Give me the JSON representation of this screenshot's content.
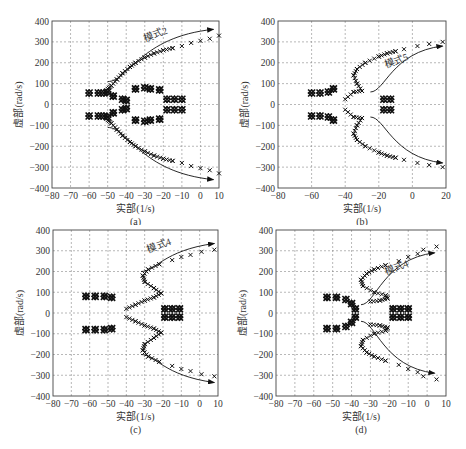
{
  "chart_data": [
    {
      "panel": "a",
      "type": "scatter",
      "caption": "(a)",
      "xlabel": "实部(1/s)",
      "ylabel": "虚部(rad/s)",
      "xlim": [
        -80,
        10
      ],
      "ylim": [
        -400,
        400
      ],
      "xticks": [
        -80,
        -70,
        -60,
        -50,
        -40,
        -30,
        -20,
        -10,
        0,
        10
      ],
      "yticks": [
        400,
        300,
        200,
        100,
        0,
        -100,
        -200,
        -300,
        -400
      ],
      "grid": true,
      "annotation": "模式2",
      "series": [
        {
          "name": "模式2 upper",
          "points": [
            [
              -50,
              75
            ],
            [
              -48,
              90
            ],
            [
              -45,
              120
            ],
            [
              -42,
              150
            ],
            [
              -38,
              180
            ],
            [
              -35,
              200
            ],
            [
              -30,
              225
            ],
            [
              -25,
              245
            ],
            [
              -20,
              260
            ],
            [
              -15,
              270
            ],
            [
              -10,
              280
            ],
            [
              -5,
              295
            ],
            [
              0,
              305
            ],
            [
              5,
              315
            ],
            [
              10,
              330
            ]
          ]
        },
        {
          "name": "模式2 lower",
          "points": [
            [
              -50,
              -75
            ],
            [
              -48,
              -90
            ],
            [
              -45,
              -120
            ],
            [
              -42,
              -150
            ],
            [
              -38,
              -180
            ],
            [
              -35,
              -200
            ],
            [
              -30,
              -225
            ],
            [
              -25,
              -245
            ],
            [
              -20,
              -260
            ],
            [
              -15,
              -270
            ],
            [
              -10,
              -280
            ],
            [
              -5,
              -295
            ],
            [
              0,
              -305
            ],
            [
              5,
              -315
            ],
            [
              10,
              -330
            ]
          ]
        },
        {
          "name": "cluster 1",
          "points": [
            [
              -60,
              55
            ],
            [
              -55,
              55
            ],
            [
              -52,
              55
            ],
            [
              -60,
              -55
            ],
            [
              -55,
              -55
            ],
            [
              -52,
              -55
            ]
          ]
        },
        {
          "name": "cluster 2",
          "points": [
            [
              -50,
              60
            ],
            [
              -47,
              40
            ],
            [
              -42,
              25
            ],
            [
              -40,
              20
            ],
            [
              -50,
              -60
            ],
            [
              -47,
              -40
            ],
            [
              -42,
              -25
            ],
            [
              -40,
              -20
            ]
          ]
        },
        {
          "name": "cluster 3",
          "points": [
            [
              -35,
              75
            ],
            [
              -30,
              80
            ],
            [
              -27,
              75
            ],
            [
              -22,
              70
            ],
            [
              -35,
              -75
            ],
            [
              -30,
              -80
            ],
            [
              -27,
              -75
            ],
            [
              -22,
              -70
            ]
          ]
        },
        {
          "name": "cluster 4",
          "points": [
            [
              -18,
              25
            ],
            [
              -14,
              25
            ],
            [
              -10,
              25
            ],
            [
              -18,
              -25
            ],
            [
              -14,
              -25
            ],
            [
              -10,
              -25
            ]
          ]
        }
      ],
      "arrows": [
        {
          "from": [
            -50,
            110
          ],
          "to": [
            7,
            360
          ]
        },
        {
          "from": [
            -50,
            -110
          ],
          "to": [
            7,
            -360
          ]
        }
      ]
    },
    {
      "panel": "b",
      "type": "scatter",
      "caption": "(b)",
      "xlabel": "实部(1/s)",
      "ylabel": "虚部(rad/s)",
      "xlim": [
        -80,
        20
      ],
      "ylim": [
        -400,
        400
      ],
      "xticks": [
        -80,
        -60,
        -40,
        -20,
        0,
        20
      ],
      "yticks": [
        400,
        300,
        200,
        100,
        0,
        -100,
        -200,
        -300,
        -400
      ],
      "grid": true,
      "annotation": "模式5",
      "series": [
        {
          "name": "模式5 upper",
          "points": [
            [
              -40,
              25
            ],
            [
              -35,
              60
            ],
            [
              -30,
              65
            ],
            [
              -33,
              100
            ],
            [
              -35,
              140
            ],
            [
              -33,
              170
            ],
            [
              -28,
              200
            ],
            [
              -20,
              230
            ],
            [
              -15,
              245
            ],
            [
              -10,
              255
            ],
            [
              -5,
              265
            ],
            [
              3,
              280
            ],
            [
              10,
              290
            ],
            [
              18,
              300
            ]
          ]
        },
        {
          "name": "模式5 lower",
          "points": [
            [
              -40,
              -25
            ],
            [
              -35,
              -60
            ],
            [
              -30,
              -65
            ],
            [
              -33,
              -100
            ],
            [
              -35,
              -140
            ],
            [
              -33,
              -170
            ],
            [
              -28,
              -200
            ],
            [
              -20,
              -230
            ],
            [
              -15,
              -245
            ],
            [
              -10,
              -255
            ],
            [
              -5,
              -265
            ],
            [
              3,
              -280
            ],
            [
              10,
              -290
            ],
            [
              18,
              -300
            ]
          ]
        },
        {
          "name": "cluster 1",
          "points": [
            [
              -60,
              55
            ],
            [
              -55,
              55
            ],
            [
              -50,
              60
            ],
            [
              -47,
              75
            ],
            [
              -60,
              -55
            ],
            [
              -55,
              -55
            ],
            [
              -50,
              -60
            ],
            [
              -47,
              -75
            ]
          ]
        },
        {
          "name": "cluster 2",
          "points": [
            [
              -17,
              25
            ],
            [
              -13,
              25
            ],
            [
              -17,
              -25
            ],
            [
              -13,
              -25
            ]
          ]
        }
      ],
      "arrows": [
        {
          "from": [
            -25,
            60
          ],
          "to": [
            18,
            280
          ]
        },
        {
          "from": [
            -25,
            -60
          ],
          "to": [
            18,
            -280
          ]
        }
      ]
    },
    {
      "panel": "c",
      "type": "scatter",
      "caption": "(c)",
      "xlabel": "实部(1/s)",
      "ylabel": "虚部(rad/s)",
      "xlim": [
        -80,
        10
      ],
      "ylim": [
        -400,
        400
      ],
      "xticks": [
        -80,
        -70,
        -60,
        -50,
        -40,
        -30,
        -20,
        -10,
        0,
        10
      ],
      "yticks": [
        400,
        300,
        200,
        100,
        0,
        -100,
        -200,
        -300,
        -400
      ],
      "grid": true,
      "annotation": "模式4",
      "series": [
        {
          "name": "模式4 upper",
          "points": [
            [
              -40,
              20
            ],
            [
              -35,
              40
            ],
            [
              -30,
              60
            ],
            [
              -25,
              75
            ],
            [
              -21,
              95
            ],
            [
              -25,
              120
            ],
            [
              -30,
              150
            ],
            [
              -31,
              180
            ],
            [
              -28,
              210
            ],
            [
              -22,
              235
            ],
            [
              -15,
              255
            ],
            [
              -10,
              270
            ],
            [
              -5,
              280
            ],
            [
              1,
              295
            ],
            [
              8,
              305
            ]
          ]
        },
        {
          "name": "模式4 lower",
          "points": [
            [
              -40,
              -20
            ],
            [
              -35,
              -40
            ],
            [
              -30,
              -60
            ],
            [
              -25,
              -75
            ],
            [
              -21,
              -95
            ],
            [
              -25,
              -120
            ],
            [
              -30,
              -150
            ],
            [
              -31,
              -180
            ],
            [
              -28,
              -210
            ],
            [
              -22,
              -235
            ],
            [
              -15,
              -255
            ],
            [
              -10,
              -270
            ],
            [
              -5,
              -280
            ],
            [
              1,
              -295
            ],
            [
              8,
              -305
            ]
          ]
        },
        {
          "name": "cluster 1",
          "points": [
            [
              -62,
              80
            ],
            [
              -57,
              80
            ],
            [
              -52,
              80
            ],
            [
              -48,
              75
            ],
            [
              -62,
              -80
            ],
            [
              -57,
              -80
            ],
            [
              -52,
              -80
            ],
            [
              -48,
              -75
            ]
          ]
        },
        {
          "name": "cluster 2",
          "points": [
            [
              -19,
              20
            ],
            [
              -15,
              20
            ],
            [
              -11,
              20
            ],
            [
              -19,
              -20
            ],
            [
              -15,
              -20
            ],
            [
              -11,
              -20
            ]
          ]
        }
      ],
      "arrows": [
        {
          "from": [
            -32,
            200
          ],
          "to": [
            8,
            335
          ]
        },
        {
          "from": [
            -32,
            -200
          ],
          "to": [
            8,
            -335
          ]
        }
      ]
    },
    {
      "panel": "d",
      "type": "scatter",
      "caption": "(d)",
      "xlabel": "实部(1/s)",
      "ylabel": "虚部(rad/s)",
      "xlim": [
        -80,
        10
      ],
      "ylim": [
        -400,
        400
      ],
      "xticks": [
        -80,
        -70,
        -60,
        -50,
        -40,
        -30,
        -20,
        -10,
        0,
        10
      ],
      "yticks": [
        400,
        300,
        200,
        100,
        0,
        -100,
        -200,
        -300,
        -400
      ],
      "grid": true,
      "annotation": "模式4",
      "series": [
        {
          "name": "模式4 upper",
          "points": [
            [
              -30,
              55
            ],
            [
              -25,
              60
            ],
            [
              -21,
              70
            ],
            [
              -22,
              85
            ],
            [
              -28,
              100
            ],
            [
              -34,
              130
            ],
            [
              -35,
              160
            ],
            [
              -32,
              190
            ],
            [
              -28,
              210
            ],
            [
              -22,
              230
            ],
            [
              -15,
              250
            ],
            [
              -10,
              270
            ],
            [
              -5,
              285
            ],
            [
              -2,
              305
            ],
            [
              5,
              320
            ]
          ]
        },
        {
          "name": "模式4 lower",
          "points": [
            [
              -30,
              -55
            ],
            [
              -25,
              -60
            ],
            [
              -21,
              -70
            ],
            [
              -22,
              -85
            ],
            [
              -28,
              -100
            ],
            [
              -34,
              -130
            ],
            [
              -35,
              -160
            ],
            [
              -32,
              -190
            ],
            [
              -28,
              -210
            ],
            [
              -22,
              -230
            ],
            [
              -15,
              -250
            ],
            [
              -10,
              -270
            ],
            [
              -5,
              -285
            ],
            [
              -2,
              -305
            ],
            [
              5,
              -320
            ]
          ]
        },
        {
          "name": "cluster 1",
          "points": [
            [
              -53,
              75
            ],
            [
              -48,
              75
            ],
            [
              -43,
              65
            ],
            [
              -40,
              45
            ],
            [
              -38,
              20
            ],
            [
              -53,
              -75
            ],
            [
              -48,
              -75
            ],
            [
              -43,
              -65
            ],
            [
              -40,
              -45
            ],
            [
              -38,
              -20
            ]
          ]
        },
        {
          "name": "cluster 2",
          "points": [
            [
              -18,
              20
            ],
            [
              -14,
              20
            ],
            [
              -10,
              20
            ],
            [
              -18,
              -20
            ],
            [
              -14,
              -20
            ],
            [
              -10,
              -20
            ]
          ]
        }
      ],
      "arrows": [
        {
          "from": [
            -35,
            40
          ],
          "to": [
            4,
            290
          ]
        },
        {
          "from": [
            -35,
            -40
          ],
          "to": [
            4,
            -290
          ]
        }
      ]
    }
  ],
  "panels": {
    "a": {
      "caption": "(a)",
      "xlabel": "实部(1/s)",
      "ylabel": "虚部(rad/s)",
      "annotation": "模式2"
    },
    "b": {
      "caption": "(b)",
      "xlabel": "实部(1/s)",
      "ylabel": "虚部(rad/s)",
      "annotation": "模式5"
    },
    "c": {
      "caption": "(c)",
      "xlabel": "实部(1/s)",
      "ylabel": "虚部(rad/s)",
      "annotation": "模式4"
    },
    "d": {
      "caption": "(d)",
      "xlabel": "实部(1/s)",
      "ylabel": "虚部(rad/s)",
      "annotation": "模式4"
    }
  }
}
